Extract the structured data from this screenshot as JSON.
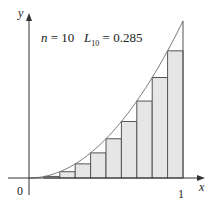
{
  "chart_data": {
    "type": "bar",
    "title": "",
    "function": "y = x^2",
    "method": "left endpoint Riemann sum",
    "annotation": {
      "n_label": "n",
      "n_value": "10",
      "sum_label": "L",
      "sum_sub": "10",
      "sum_value": "0.285"
    },
    "xlabel": "x",
    "ylabel": "y",
    "x_ticks": [
      "0",
      "1"
    ],
    "xlim": [
      0,
      1
    ],
    "ylim": [
      0,
      1
    ],
    "grid": false,
    "categories": [
      0.0,
      0.1,
      0.2,
      0.3,
      0.4,
      0.5,
      0.6,
      0.7,
      0.8,
      0.9
    ],
    "values": [
      0.0,
      0.01,
      0.04,
      0.09,
      0.16,
      0.25,
      0.36,
      0.49,
      0.64,
      0.81
    ],
    "bar_width": 0.1,
    "colors": {
      "bar_fill": "#e6e6e6",
      "bar_stroke": "#555555",
      "curve": "#777777",
      "axis": "#333333"
    }
  }
}
